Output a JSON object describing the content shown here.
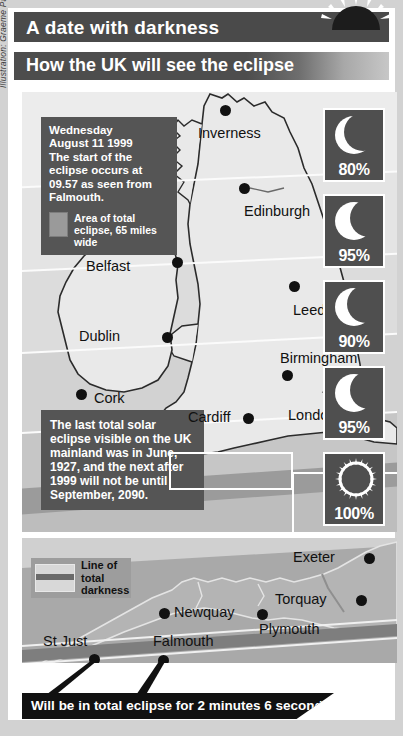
{
  "credit": "Illustration: Graeme Park/PA",
  "header": {
    "title": "A date with darkness",
    "subtitle": "How the UK will see the eclipse",
    "sun_icon": "half-sun-icon"
  },
  "date_box": {
    "lines": "Wednesday August 11 1999 The start of the eclipse occurs at 09.57 as seen from Falmouth.",
    "legend_label": "Area of total eclipse, 65 miles wide"
  },
  "fact_box": {
    "text": "The last total solar eclipse visible on the UK mainland was in June, 1927, and the next after 1999 will not be until September, 2090."
  },
  "main_map": {
    "cities": [
      {
        "name": "Inverness",
        "x": 202,
        "y": 36,
        "dot_x": 203,
        "dot_y": 18,
        "label_x": 176,
        "label_y": 33
      },
      {
        "name": "Edinburgh",
        "x": 222,
        "y": 124,
        "dot_x": 222,
        "dot_y": 96,
        "label_x": 222,
        "label_y": 111
      },
      {
        "name": "Belfast",
        "x": 128,
        "y": 175,
        "dot_x": 155,
        "dot_y": 170,
        "label_x": 64,
        "label_y": 166
      },
      {
        "name": "Leeds",
        "x": 272,
        "y": 216,
        "dot_x": 272,
        "dot_y": 194,
        "label_x": 271,
        "label_y": 210
      },
      {
        "name": "Dublin",
        "x": 98,
        "y": 245,
        "dot_x": 145,
        "dot_y": 245,
        "label_x": 57,
        "label_y": 236
      },
      {
        "name": "Birmingham",
        "x": 262,
        "y": 268,
        "dot_x": 265,
        "dot_y": 283,
        "label_x": 258,
        "label_y": 258
      },
      {
        "name": "Cork",
        "x": 74,
        "y": 307,
        "dot_x": 59,
        "dot_y": 302,
        "label_x": 72,
        "label_y": 298
      },
      {
        "name": "Cardiff",
        "x": 210,
        "y": 327,
        "dot_x": 226,
        "dot_y": 326,
        "label_x": 166,
        "label_y": 317
      },
      {
        "name": "London",
        "x": 302,
        "y": 324,
        "dot_x": 348,
        "dot_y": 320,
        "label_x": 266,
        "label_y": 315
      }
    ]
  },
  "percent_panels": [
    {
      "value": "80%",
      "icon": "crescent-thick-icon",
      "top": 100
    },
    {
      "value": "95%",
      "icon": "crescent-thin-icon",
      "top": 186
    },
    {
      "value": "90%",
      "icon": "crescent-medium-icon",
      "top": 272
    },
    {
      "value": "95%",
      "icon": "crescent-thin-icon",
      "top": 358
    },
    {
      "value": "100%",
      "icon": "corona-sun-icon",
      "top": 444
    }
  ],
  "inset_map": {
    "legend_label": "Line of total darkness",
    "cities": [
      {
        "name": "Exeter",
        "dot_x": 347,
        "dot_y": 20,
        "label_x": 271,
        "label_y": 11
      },
      {
        "name": "Torquay",
        "dot_x": 339,
        "dot_y": 62,
        "label_x": 253,
        "label_y": 53
      },
      {
        "name": "Newquay",
        "dot_x": 142,
        "dot_y": 75,
        "label_x": 152,
        "label_y": 66
      },
      {
        "name": "Plymouth",
        "dot_x": 240,
        "dot_y": 76,
        "label_x": 237,
        "label_y": 83
      },
      {
        "name": "Falmouth",
        "dot_x": 141,
        "dot_y": 122,
        "label_x": 131,
        "label_y": 95
      },
      {
        "name": "St Just",
        "dot_x": 72,
        "dot_y": 121,
        "label_x": 21,
        "label_y": 95
      }
    ]
  },
  "banner": {
    "text": "Will be in total eclipse for 2 minutes 6 seconds"
  },
  "colors": {
    "bar_dark": "#4a4a4a",
    "box_gray": "#555555",
    "banner_black": "#111111",
    "panel_gray": "#4f4f4f"
  }
}
